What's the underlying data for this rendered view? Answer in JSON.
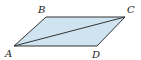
{
  "diagram": {
    "type": "parallelogram",
    "fill_color": "#cfe3f1",
    "stroke_color": "#333333",
    "vertices": [
      {
        "label": "A",
        "x": 14,
        "y": 46,
        "lx": 5,
        "ly": 57
      },
      {
        "label": "B",
        "x": 46,
        "y": 17,
        "lx": 38,
        "ly": 13
      },
      {
        "label": "C",
        "x": 125,
        "y": 17,
        "lx": 127,
        "ly": 13
      },
      {
        "label": "D",
        "x": 97,
        "y": 46,
        "lx": 92,
        "ly": 58
      }
    ],
    "diagonal": [
      "A",
      "C"
    ]
  }
}
